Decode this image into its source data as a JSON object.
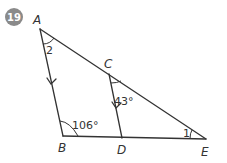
{
  "problem": {
    "number": "19",
    "badge_color": "#8a8a8a"
  },
  "figure": {
    "points": [
      {
        "name": "A",
        "label": "A"
      },
      {
        "name": "B",
        "label": "B"
      },
      {
        "name": "C",
        "label": "C"
      },
      {
        "name": "D",
        "label": "D"
      },
      {
        "name": "E",
        "label": "E"
      }
    ],
    "angles": {
      "at_A": "2",
      "at_C": "43°",
      "at_B": "106°",
      "at_E": "1"
    },
    "parallel_marks": [
      "AB",
      "CD"
    ],
    "line_color": "#333333"
  }
}
